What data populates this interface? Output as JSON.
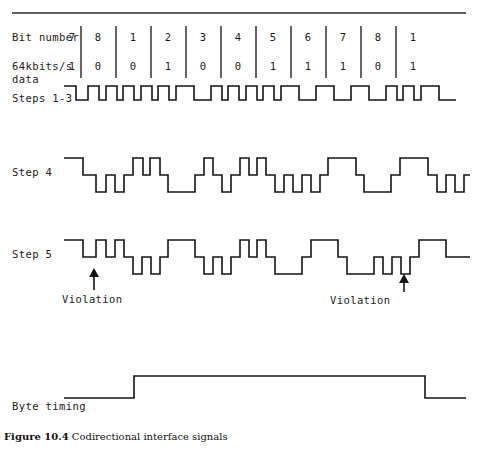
{
  "figure": {
    "caption_number": "Figure 10.4",
    "caption_text": " Codirectional interface signals",
    "title": "Codirectional interface signals"
  },
  "table": {
    "row_labels": {
      "bit_number": "Bit number",
      "data_line1": "64kbits/s",
      "data_line2": "data"
    },
    "bit_numbers": [
      "7",
      "8",
      "1",
      "2",
      "3",
      "4",
      "5",
      "6",
      "7",
      "8",
      "1"
    ],
    "data_bits": [
      "1",
      "0",
      "0",
      "1",
      "0",
      "0",
      "1",
      "1",
      "1",
      "0",
      "1"
    ],
    "columns": 11,
    "separator_columns": [
      1,
      2,
      3,
      4,
      5,
      6,
      7,
      8,
      9,
      10
    ]
  },
  "waveforms": [
    {
      "id": "steps-1-3",
      "label": "Steps 1-3",
      "levels": 2
    },
    {
      "id": "step-4",
      "label": "Step 4",
      "levels": 3
    },
    {
      "id": "step-5",
      "label": "Step 5",
      "levels": 3
    },
    {
      "id": "byte-timing",
      "label": "Byte timing",
      "levels": 2
    }
  ],
  "annotations": [
    {
      "id": "violation-left",
      "label": "Violation",
      "marker": "up-arrow"
    },
    {
      "id": "violation-right",
      "label": "Violation",
      "marker": "up-arrow"
    }
  ],
  "colors": {
    "ink": "#141414",
    "background": "#ffffff",
    "rule": "#2a2a2a"
  }
}
